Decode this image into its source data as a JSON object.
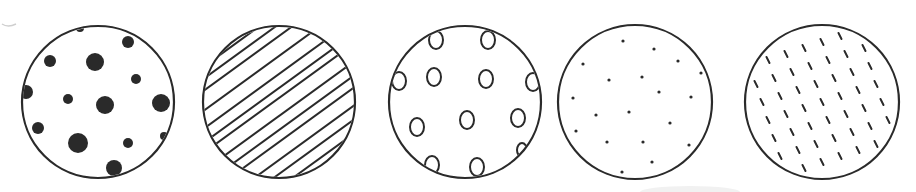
{
  "diagram": {
    "type": "pattern-circles",
    "stroke_color": "#2a2a2a",
    "fill_color": "#ffffff",
    "circles": [
      {
        "id": "circle-1",
        "pattern": "large-filled-dots",
        "cx": 98,
        "cy": 102,
        "r": 76,
        "dots": [
          [
            80,
            28,
            4
          ],
          [
            128,
            42,
            6
          ],
          [
            50,
            61,
            6
          ],
          [
            95,
            62,
            9
          ],
          [
            136,
            79,
            5
          ],
          [
            26,
            92,
            7
          ],
          [
            68,
            99,
            5
          ],
          [
            105,
            105,
            9
          ],
          [
            161,
            103,
            9
          ],
          [
            38,
            128,
            6
          ],
          [
            78,
            143,
            10
          ],
          [
            128,
            143,
            5
          ],
          [
            164,
            136,
            4
          ],
          [
            114,
            168,
            8
          ]
        ]
      },
      {
        "id": "circle-2",
        "pattern": "diagonal-hatching",
        "cx": 279,
        "cy": 102,
        "r": 76
      },
      {
        "id": "circle-3",
        "pattern": "hollow-ovals",
        "cx": 465,
        "cy": 102,
        "r": 76,
        "ovals": [
          [
            436,
            40,
            7,
            9
          ],
          [
            488,
            40,
            7,
            9
          ],
          [
            399,
            81,
            7,
            9
          ],
          [
            434,
            77,
            7,
            9
          ],
          [
            486,
            79,
            7,
            9
          ],
          [
            533,
            82,
            7,
            9
          ],
          [
            467,
            120,
            7,
            9
          ],
          [
            417,
            127,
            7,
            9
          ],
          [
            518,
            118,
            7,
            9
          ],
          [
            432,
            165,
            7,
            9
          ],
          [
            477,
            167,
            7,
            9
          ],
          [
            522,
            150,
            5,
            7
          ]
        ]
      },
      {
        "id": "circle-4",
        "pattern": "small-fine-dots",
        "cx": 635,
        "cy": 102,
        "r": 77,
        "dots": [
          [
            623,
            41
          ],
          [
            654,
            49
          ],
          [
            583,
            64
          ],
          [
            678,
            61
          ],
          [
            609,
            80
          ],
          [
            642,
            77
          ],
          [
            701,
            73
          ],
          [
            573,
            98
          ],
          [
            659,
            92
          ],
          [
            691,
            97
          ],
          [
            596,
            115
          ],
          [
            629,
            112
          ],
          [
            670,
            123
          ],
          [
            576,
            131
          ],
          [
            607,
            142
          ],
          [
            643,
            142
          ],
          [
            689,
            145
          ],
          [
            652,
            162
          ],
          [
            622,
            172
          ]
        ]
      },
      {
        "id": "circle-5",
        "pattern": "short-dashes",
        "cx": 822,
        "cy": 102,
        "r": 77
      }
    ]
  }
}
